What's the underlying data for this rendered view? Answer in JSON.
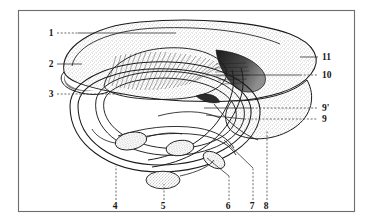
{
  "figure": {
    "frame": {
      "x": 18,
      "y": 10,
      "width": 337,
      "height": 202,
      "border_color": "#6d6d6d"
    },
    "ink_color": "#1b1b1b",
    "stipple_color": "#585858",
    "background": "#ffffff"
  },
  "callouts": [
    {
      "id": "1",
      "label": "1",
      "text_x": 51,
      "text_y": 36,
      "leader": "dotted-then-solid",
      "side": "left"
    },
    {
      "id": "2",
      "label": "2",
      "text_x": 51,
      "text_y": 67,
      "leader": "solid",
      "side": "left"
    },
    {
      "id": "3",
      "label": "3",
      "text_x": 51,
      "text_y": 97,
      "leader": "dashed",
      "side": "left"
    },
    {
      "id": "4",
      "label": "4",
      "text_x": 115,
      "text_y": 209,
      "leader": "dashed",
      "side": "bottom"
    },
    {
      "id": "5",
      "label": "5",
      "text_x": 163,
      "text_y": 209,
      "leader": "dashed",
      "side": "bottom"
    },
    {
      "id": "6",
      "label": "6",
      "text_x": 228,
      "text_y": 209,
      "leader": "solid",
      "side": "bottom"
    },
    {
      "id": "7",
      "label": "7",
      "text_x": 252,
      "text_y": 209,
      "leader": "solid",
      "side": "bottom"
    },
    {
      "id": "8",
      "label": "8",
      "text_x": 266,
      "text_y": 209,
      "leader": "dashed",
      "side": "bottom"
    },
    {
      "id": "9",
      "label": "9",
      "text_x": 325,
      "text_y": 122,
      "leader": "dashed",
      "side": "right"
    },
    {
      "id": "9p",
      "label": "9'",
      "text_x": 325,
      "text_y": 111,
      "leader": "dashed",
      "side": "right"
    },
    {
      "id": "10",
      "label": "10",
      "text_x": 325,
      "text_y": 78,
      "leader": "dashed-then-solid",
      "side": "right"
    },
    {
      "id": "11",
      "label": "11",
      "text_x": 325,
      "text_y": 60,
      "leader": "solid",
      "side": "right"
    }
  ]
}
